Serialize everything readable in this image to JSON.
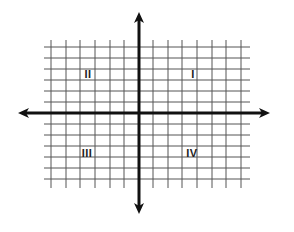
{
  "diagram": {
    "type": "coordinate-plane",
    "colors": {
      "grid": "#555555",
      "axis": "#111111",
      "background": "#ffffff"
    },
    "grid": {
      "vertical_x": [
        51,
        66,
        80,
        95,
        110,
        124,
        153,
        168,
        182,
        197,
        212,
        226,
        241
      ],
      "horizontal_y": [
        47,
        58,
        69,
        80,
        91,
        102,
        124,
        135,
        146,
        157,
        168,
        179
      ],
      "x_range": [
        44,
        250
      ],
      "y_range": [
        40,
        188
      ]
    },
    "axes": {
      "origin": {
        "x": 139,
        "y": 113
      },
      "x_axis": {
        "from": 18,
        "to": 270,
        "arrows": "both"
      },
      "y_axis": {
        "from": 12,
        "to": 214,
        "arrows": "both"
      }
    },
    "quadrants": [
      {
        "label": "I",
        "x": 193,
        "y": 78
      },
      {
        "label": "II",
        "x": 88,
        "y": 78
      },
      {
        "label": "III",
        "x": 87,
        "y": 157
      },
      {
        "label": "IV",
        "x": 192,
        "y": 157
      }
    ]
  }
}
